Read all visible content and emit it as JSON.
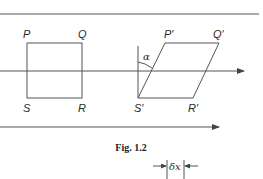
{
  "figure": {
    "caption": "Fig. 1.2",
    "original_shape": {
      "type": "square",
      "vertices": {
        "top_left": "P",
        "top_right": "Q",
        "bottom_right": "R",
        "bottom_left": "S"
      }
    },
    "sheared_shape": {
      "type": "parallelogram",
      "vertices": {
        "top_left": "P′",
        "top_right": "Q′",
        "bottom_right": "R′",
        "bottom_left": "S′"
      }
    },
    "angle_label": "α",
    "displacement_label": "δx",
    "arrows": [
      "middle-horizontal-arrow",
      "bottom-horizontal-arrow"
    ]
  },
  "colors": {
    "line": "#555555",
    "text": "#2a2a2a",
    "background": "#ffffff"
  }
}
